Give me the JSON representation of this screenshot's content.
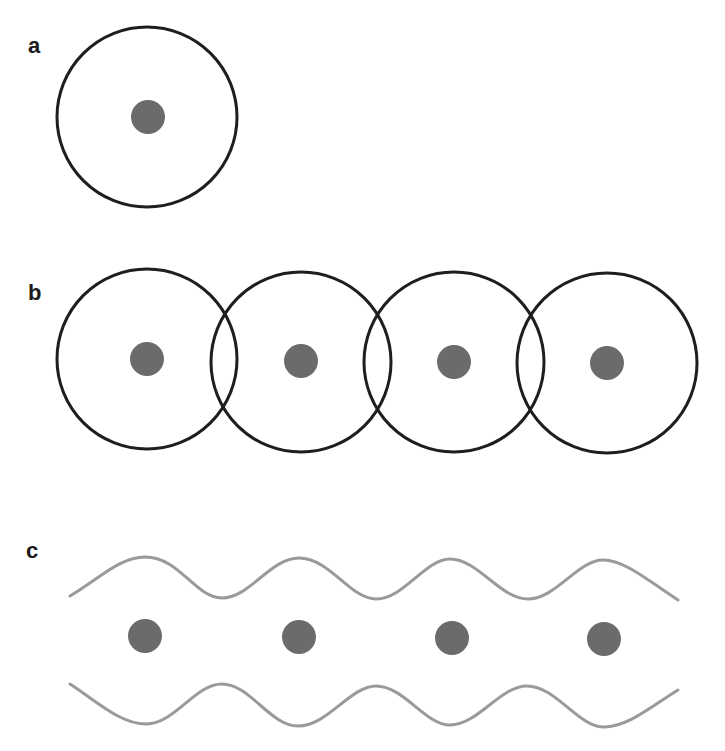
{
  "panels": [
    {
      "label": "a",
      "description": "single atom with circular electron orbit",
      "atom_count": 1
    },
    {
      "label": "b",
      "description": "row of atoms with overlapping circular orbits",
      "atom_count": 4
    },
    {
      "label": "c",
      "description": "row of atoms between two wavy boundaries",
      "atom_count": 4
    }
  ],
  "colors": {
    "orbit": "#1e1e1e",
    "atom": "#6b6b6b",
    "wave": "#9a9a9a",
    "label": "#1a1a1a",
    "background": "#ffffff"
  }
}
